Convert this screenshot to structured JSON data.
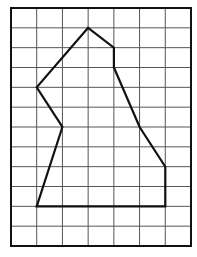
{
  "diagram": {
    "type": "grid-polygon",
    "grid": {
      "columns": 7,
      "rows": 12
    },
    "colors": {
      "background": "#ffffff",
      "grid_line": "#555555",
      "border": "#111111",
      "polygon": "#111111"
    },
    "polygon_vertices": [
      [
        3,
        1
      ],
      [
        4,
        2
      ],
      [
        4,
        3
      ],
      [
        5,
        6
      ],
      [
        6,
        8
      ],
      [
        6,
        10
      ],
      [
        1,
        10
      ],
      [
        2,
        6
      ],
      [
        1,
        4
      ]
    ]
  }
}
